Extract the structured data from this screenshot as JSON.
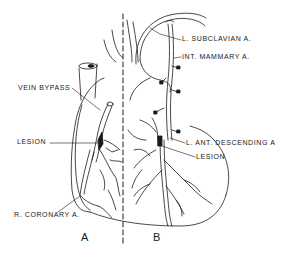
{
  "figure": {
    "type": "anatomical line drawing",
    "divider": "dashed vertical line",
    "panels": [
      {
        "id": "A",
        "label": "A",
        "labels": [
          {
            "id": "vein_bypass",
            "text": "VEIN BYPASS"
          },
          {
            "id": "lesion_a",
            "text": "LESION"
          },
          {
            "id": "r_coronary",
            "text": "R. CORONARY A."
          }
        ]
      },
      {
        "id": "B",
        "label": "B",
        "labels": [
          {
            "id": "l_subclavian",
            "text": "L. SUBCLAVIAN A."
          },
          {
            "id": "int_mammary",
            "text": "INT. MAMMARY A."
          },
          {
            "id": "l_ant_desc",
            "text": "L. ANT. DESCENDING A"
          },
          {
            "id": "lesion_b",
            "text": "LESION"
          }
        ]
      }
    ]
  },
  "colors": {
    "ink": "#1a1a1a",
    "background": "#ffffff"
  }
}
